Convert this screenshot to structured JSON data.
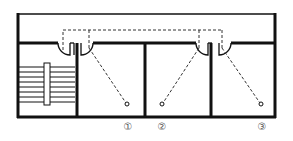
{
  "diagram": {
    "type": "floor-plan",
    "colors": {
      "wall": "#111111",
      "path": "#333333",
      "label": "#555555"
    },
    "rooms": [
      {
        "id": "stairwell",
        "content": "stairs"
      },
      {
        "id": "room-1"
      },
      {
        "id": "room-2"
      },
      {
        "id": "room-3"
      }
    ],
    "points": [
      {
        "label": "①",
        "x": 128,
        "y": 104
      },
      {
        "label": "②",
        "x": 162,
        "y": 104
      },
      {
        "label": "③",
        "x": 262,
        "y": 104
      }
    ],
    "labels": [
      "①",
      "②",
      "③"
    ]
  }
}
